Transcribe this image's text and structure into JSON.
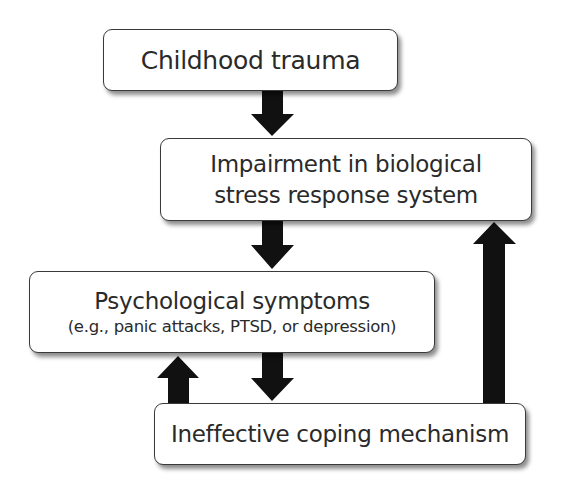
{
  "diagram": {
    "type": "flowchart",
    "nodes": [
      {
        "id": "childhood-trauma",
        "lines": [
          "Childhood trauma"
        ]
      },
      {
        "id": "impairment",
        "lines": [
          "Impairment in biological",
          "stress response system"
        ]
      },
      {
        "id": "psych-symptoms",
        "lines": [
          "Psychological symptoms",
          "(e.g., panic attacks, PTSD, or depression)"
        ]
      },
      {
        "id": "coping",
        "lines": [
          "Ineffective coping mechanism"
        ]
      }
    ],
    "edges": [
      {
        "from": "childhood-trauma",
        "to": "impairment"
      },
      {
        "from": "impairment",
        "to": "psych-symptoms"
      },
      {
        "from": "psych-symptoms",
        "to": "coping"
      },
      {
        "from": "coping",
        "to": "psych-symptoms"
      },
      {
        "from": "coping",
        "to": "impairment"
      }
    ],
    "colors": {
      "arrow": "#111111",
      "box_border": "#3a3a3a",
      "box_fill": "#ffffff",
      "text": "#2a2a2a"
    }
  }
}
